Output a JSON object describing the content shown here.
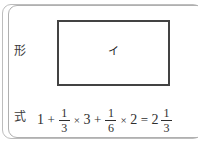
{
  "card": {
    "rows": [
      {
        "label": "形",
        "shape_label": "イ"
      },
      {
        "label": "式"
      }
    ]
  },
  "expression": {
    "full_text": "1 + 1/3 × 3 + 1/6 × 2 = 2 1/3",
    "tokens": {
      "t1": "1",
      "op1": "+",
      "f1_num": "1",
      "f1_den": "3",
      "op2": "×",
      "t2": "3",
      "op3": "+",
      "f2_num": "1",
      "f2_den": "6",
      "op4": "×",
      "t3": "2",
      "op5": "=",
      "result_whole": "2",
      "result_num": "1",
      "result_den": "3"
    }
  },
  "colors": {
    "card_border": "#b0b0b0",
    "outer_border": "#bdbdbd",
    "shape_border": "#434343",
    "text": "#2e2e2e",
    "background": "#ffffff"
  }
}
